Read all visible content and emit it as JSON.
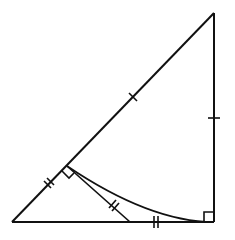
{
  "diagram": {
    "type": "geometry",
    "colors": {
      "stroke": "#111111",
      "background": "#ffffff"
    },
    "points": {
      "A": {
        "role": "bottom-left vertex",
        "x": 12,
        "y": 222
      },
      "B": {
        "role": "top-right vertex",
        "x": 214,
        "y": 13
      },
      "C": {
        "role": "bottom-right vertex (right angle)",
        "x": 214,
        "y": 222
      },
      "D": {
        "role": "point on hypotenuse AB (right angle marker)",
        "x": 67,
        "y": 166
      },
      "E": {
        "role": "point on base AC",
        "x": 130,
        "y": 222
      }
    },
    "segments": [
      {
        "from": "A",
        "to": "B",
        "label": "hypotenuse"
      },
      {
        "from": "B",
        "to": "C",
        "label": "right leg"
      },
      {
        "from": "A",
        "to": "C",
        "label": "base"
      },
      {
        "from": "D",
        "to": "E",
        "label": "perpendicular to AB"
      }
    ],
    "arc": {
      "center": "B",
      "from": "D",
      "to": "C"
    },
    "right_angles": [
      "C",
      "D"
    ],
    "tick_marks": [
      {
        "segment": "DB",
        "count": 1
      },
      {
        "segment": "BC",
        "count": 1
      },
      {
        "segment": "AD",
        "count": 2
      },
      {
        "segment": "DE",
        "count": 2
      },
      {
        "segment": "EC",
        "count": 2
      }
    ]
  }
}
